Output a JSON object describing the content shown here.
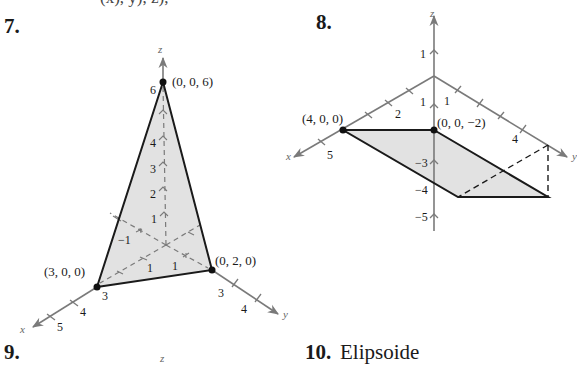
{
  "page": {
    "top_cut_text": "(x), y), z),",
    "problems": [
      {
        "number": "7.",
        "title": ""
      },
      {
        "number": "8.",
        "title": ""
      },
      {
        "number": "9.",
        "title": ""
      },
      {
        "number": "10.",
        "title": "Elipsoide"
      }
    ]
  },
  "figure7": {
    "axes": {
      "x": "x",
      "y": "y",
      "z": "z"
    },
    "points": [
      {
        "label": "(0, 0, 6)"
      },
      {
        "label": "(3, 0, 0)"
      },
      {
        "label": "(0, 2, 0)"
      }
    ],
    "z_ticks": [
      "6",
      "4",
      "3",
      "2",
      "1"
    ],
    "x_ticks": [
      "1",
      "3",
      "4",
      "5",
      "−1"
    ],
    "y_ticks": [
      "1",
      "3",
      "4"
    ],
    "colors": {
      "fill": "#e2e2e2",
      "edge": "#1a1a1a",
      "axis": "#7a7a7a"
    }
  },
  "figure8": {
    "axes": {
      "x": "x",
      "y": "y",
      "z": "z"
    },
    "points": [
      {
        "label": "(4, 0, 0)"
      },
      {
        "label": "(0, 0, −2)"
      }
    ],
    "z_ticks": [
      "1",
      "1",
      "−3",
      "−4",
      "−5"
    ],
    "x_ticks": [
      "2",
      "5"
    ],
    "y_ticks": [
      "1",
      "4"
    ],
    "colors": {
      "fill": "#e2e2e2",
      "edge": "#1a1a1a",
      "axis": "#7a7a7a"
    }
  },
  "figure9": {
    "axes": {
      "z": "z"
    }
  }
}
